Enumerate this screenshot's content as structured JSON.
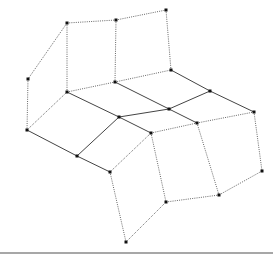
{
  "diagram": {
    "type": "graph",
    "width": 279,
    "height": 260,
    "colors": {
      "solid_edge": "#444444",
      "dotted_edge": "#555555",
      "vertex": "#111111",
      "rule": "#8a8a8a",
      "background": "#ffffff"
    },
    "vertices": {
      "A": [
        67,
        23
      ],
      "B": [
        116,
        20
      ],
      "C": [
        166,
        10
      ],
      "D": [
        28,
        79
      ],
      "E": [
        67,
        92
      ],
      "F": [
        115,
        82
      ],
      "G": [
        171,
        70
      ],
      "H": [
        27,
        130
      ],
      "I": [
        119,
        117
      ],
      "J": [
        210,
        91
      ],
      "K": [
        77,
        156
      ],
      "L": [
        169,
        109
      ],
      "M": [
        254,
        112
      ],
      "N": [
        110,
        172
      ],
      "O": [
        197,
        123
      ],
      "P2": [
        151,
        133
      ],
      "P": [
        166,
        202
      ],
      "Q": [
        219,
        195
      ],
      "R": [
        262,
        171
      ],
      "S": [
        126,
        242
      ]
    },
    "solid_edges": [
      [
        "E",
        "I"
      ],
      [
        "I",
        "P2"
      ],
      [
        "F",
        "L"
      ],
      [
        "L",
        "O"
      ],
      [
        "G",
        "J"
      ],
      [
        "J",
        "M"
      ],
      [
        "H",
        "K"
      ],
      [
        "K",
        "N"
      ],
      [
        "K",
        "I"
      ],
      [
        "I",
        "L"
      ],
      [
        "L",
        "J"
      ]
    ],
    "dotted_edges": [
      [
        "A",
        "B"
      ],
      [
        "B",
        "C"
      ],
      [
        "A",
        "D"
      ],
      [
        "D",
        "H"
      ],
      [
        "A",
        "E"
      ],
      [
        "B",
        "F"
      ],
      [
        "C",
        "G"
      ],
      [
        "E",
        "F"
      ],
      [
        "F",
        "G"
      ],
      [
        "H",
        "E"
      ],
      [
        "N",
        "P2"
      ],
      [
        "P2",
        "O"
      ],
      [
        "O",
        "M"
      ],
      [
        "N",
        "S"
      ],
      [
        "S",
        "P"
      ],
      [
        "P2",
        "P"
      ],
      [
        "O",
        "Q"
      ],
      [
        "M",
        "R"
      ],
      [
        "P",
        "Q"
      ],
      [
        "Q",
        "R"
      ]
    ],
    "rule": {
      "x1": 0,
      "x2": 273,
      "y": 253
    }
  }
}
